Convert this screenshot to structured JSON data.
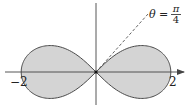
{
  "figure": {
    "curve": {
      "equation": "r^2 = 4 cos(2θ)",
      "a": 2,
      "fill_color": "#d4d4d4",
      "stroke_color": "#4a4a4a"
    },
    "axes": {
      "color": "#444444",
      "x_tick_labels": [
        {
          "value": -2,
          "text": "−2"
        },
        {
          "value": 2,
          "text": "2"
        }
      ]
    },
    "ray": {
      "angle_label_lhs": "θ =",
      "angle_numerator": "π",
      "angle_denominator": "4",
      "angle_rad": 0.7853981634
    }
  },
  "layout": {
    "origin_x": 96,
    "origin_y": 72,
    "scale": 37.4
  }
}
